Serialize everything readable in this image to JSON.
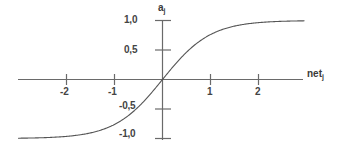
{
  "figure": {
    "name": "sigmoid-activation-function-plot",
    "background_color": "#ffffff",
    "line_color": "#555555",
    "axis_color": "#666666",
    "text_color": "#3a3a3a"
  },
  "axes": {
    "x_title_base": "net",
    "x_title_sub": "j",
    "y_title_base": "a",
    "y_title_sub": "j"
  },
  "ticks": {
    "x": [
      {
        "label": "-2",
        "value": -2
      },
      {
        "label": "-1",
        "value": -1
      },
      {
        "label": "1",
        "value": 1
      },
      {
        "label": "2",
        "value": 2
      }
    ],
    "y": [
      {
        "label": "1,0",
        "value": 1.0
      },
      {
        "label": "0,5",
        "value": 0.5
      },
      {
        "label": "-0,5",
        "value": -0.5
      },
      {
        "label": "-1,0",
        "value": -1.0
      }
    ]
  },
  "chart_data": {
    "type": "line",
    "title": "",
    "subtitle": "",
    "xlabel": "net_j",
    "ylabel": "a_j",
    "xlim": [
      -3.0,
      3.0
    ],
    "ylim": [
      -1.15,
      1.15
    ],
    "grid": false,
    "legend": null,
    "decimal_separator": ",",
    "function": "tanh(x)",
    "series": [
      {
        "name": "a_j = tanh(net_j)",
        "color": "#555555",
        "x": [
          -3.0,
          -2.8,
          -2.6,
          -2.4,
          -2.2,
          -2.0,
          -1.8,
          -1.6,
          -1.4,
          -1.2,
          -1.0,
          -0.8,
          -0.6,
          -0.4,
          -0.2,
          0.0,
          0.2,
          0.4,
          0.6,
          0.8,
          1.0,
          1.2,
          1.4,
          1.6,
          1.8,
          2.0,
          2.2,
          2.4,
          2.6,
          2.8,
          3.0
        ],
        "y": [
          -0.995,
          -0.993,
          -0.989,
          -0.984,
          -0.976,
          -0.964,
          -0.947,
          -0.922,
          -0.885,
          -0.834,
          -0.762,
          -0.664,
          -0.537,
          -0.38,
          -0.197,
          0.0,
          0.197,
          0.38,
          0.537,
          0.664,
          0.762,
          0.834,
          0.885,
          0.922,
          0.947,
          0.964,
          0.976,
          0.984,
          0.989,
          0.993,
          0.995
        ]
      }
    ],
    "annotations": [],
    "axis_ticks_x": [
      -2,
      -1,
      1,
      2
    ],
    "axis_ticks_y": [
      1.0,
      0.5,
      -0.5,
      -1.0
    ]
  }
}
